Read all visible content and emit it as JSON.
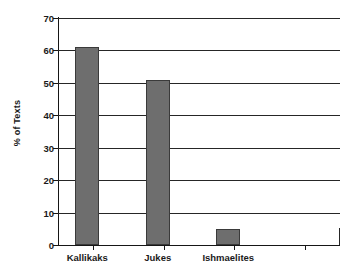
{
  "chart_data": {
    "type": "bar",
    "title": "",
    "subtitle": "",
    "xlabel": "",
    "ylabel": "% of Texts",
    "categories": [
      "Kallikaks",
      "Jukes",
      "Ishmaelites",
      ""
    ],
    "values": [
      61,
      51,
      5,
      null
    ],
    "ylim": [
      0,
      70
    ],
    "ytick_labels": [
      "0",
      "10",
      "20",
      "30",
      "40",
      "50",
      "60",
      "70"
    ],
    "ytick_values": [
      0,
      10,
      20,
      30,
      40,
      50,
      60,
      70
    ],
    "grid": "horizontal",
    "legend": "none",
    "series": [
      {
        "name": "% of Texts",
        "color": "#6e6e6e",
        "values": [
          61,
          51,
          5,
          null
        ]
      }
    ],
    "annotations": []
  },
  "style": {
    "bar_fill": "#6e6e6e",
    "bar_border": "#3a3a3a",
    "axis_color": "#161616",
    "grid_color": "#262626",
    "background": "#ffffff",
    "text_color": "#1a1a1a"
  }
}
